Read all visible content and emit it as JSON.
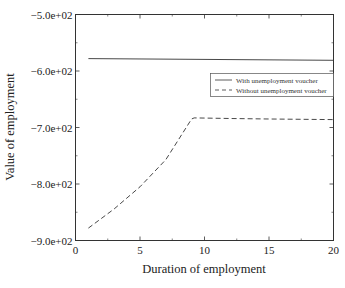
{
  "chart_data": {
    "type": "line",
    "title": "",
    "xlabel": "Duration of employment",
    "ylabel": "Value of employment",
    "xlim": [
      0,
      20
    ],
    "ylim": [
      -900,
      -500
    ],
    "xticks": [
      "0",
      "5",
      "10",
      "15",
      "20"
    ],
    "yticks": [
      "-5.0e+02",
      "-6.0e+02",
      "-7.0e+02",
      "-8.0e+02",
      "-9.0e+02"
    ],
    "grid": false,
    "legend_position": "upper right (inside, below top)",
    "series": [
      {
        "name": "With unemployment voucher",
        "style": "solid",
        "x": [
          1,
          20
        ],
        "y": [
          -578,
          -581
        ]
      },
      {
        "name": "Without unemployment voucher",
        "style": "dashed",
        "x": [
          1,
          3,
          5,
          7,
          9,
          9.2,
          12,
          15,
          20
        ],
        "y": [
          -878,
          -844,
          -805,
          -757,
          -685,
          -683,
          -684,
          -685,
          -686
        ]
      }
    ]
  }
}
